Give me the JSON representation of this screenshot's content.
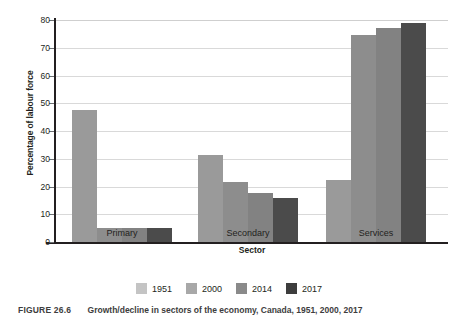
{
  "chart_data": {
    "type": "bar",
    "title": "",
    "xlabel": "Sector",
    "ylabel": "Percentage of labour force",
    "categories": [
      "Primary",
      "Secondary",
      "Services"
    ],
    "series": [
      {
        "name": "1951",
        "color": "#9a9a9a",
        "legend_color": "#c4c4c4",
        "values": [
          47.5,
          31.5,
          22.5
        ]
      },
      {
        "name": "2000",
        "color": "#8d8d8d",
        "legend_color": "#a8a8a8",
        "values": [
          5.0,
          21.5,
          74.5
        ]
      },
      {
        "name": "2014",
        "color": "#828282",
        "legend_color": "#8a8a8a",
        "values": [
          5.0,
          17.5,
          77.0
        ]
      },
      {
        "name": "2017",
        "color": "#4b4b4b",
        "legend_color": "#3d3d3d",
        "values": [
          5.0,
          16.0,
          79.0
        ]
      }
    ],
    "ylim": [
      0,
      80
    ],
    "yticks": [
      0,
      10,
      20,
      30,
      40,
      50,
      60,
      70,
      80
    ],
    "ytick_labels": [
      "0",
      "10",
      "20",
      "30",
      "40",
      "50",
      "60",
      "70",
      "80"
    ],
    "grid": true,
    "legend_position": "bottom"
  },
  "axis": {
    "y_title": "Percentage of labour force",
    "x_title": "Sector",
    "tick_0": "0",
    "tick_10": "10",
    "tick_20": "20",
    "tick_30": "30",
    "tick_40": "40",
    "tick_50": "50",
    "tick_60": "60",
    "tick_70": "70",
    "tick_80": "80"
  },
  "categories": {
    "primary": "Primary",
    "secondary": "Secondary",
    "services": "Services"
  },
  "legend": {
    "items": [
      {
        "label": "1951"
      },
      {
        "label": "2000"
      },
      {
        "label": "2014"
      },
      {
        "label": "2017"
      }
    ]
  },
  "caption": {
    "number": "FIGURE 26.6",
    "text": "Growth/decline in sectors of the economy, Canada, 1951, 2000, 2017"
  }
}
